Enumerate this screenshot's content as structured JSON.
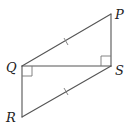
{
  "figure": {
    "type": "geometry-diagram",
    "points": {
      "P": {
        "label": "P",
        "x": 111,
        "y": 14
      },
      "Q": {
        "label": "Q",
        "x": 22,
        "y": 66
      },
      "S": {
        "label": "S",
        "x": 111,
        "y": 66
      },
      "R": {
        "label": "R",
        "x": 22,
        "y": 117
      }
    },
    "segments": [
      "PQ",
      "PS",
      "QS",
      "QR",
      "RS"
    ],
    "right_angles": [
      "PSQ",
      "SQR"
    ],
    "equal_marks": [
      "PQ",
      "RS"
    ],
    "labels": {
      "P": "P",
      "Q": "Q",
      "S": "S",
      "R": "R"
    },
    "colors": {
      "line": "#555555",
      "text": "#222222",
      "background": "#ffffff"
    }
  }
}
